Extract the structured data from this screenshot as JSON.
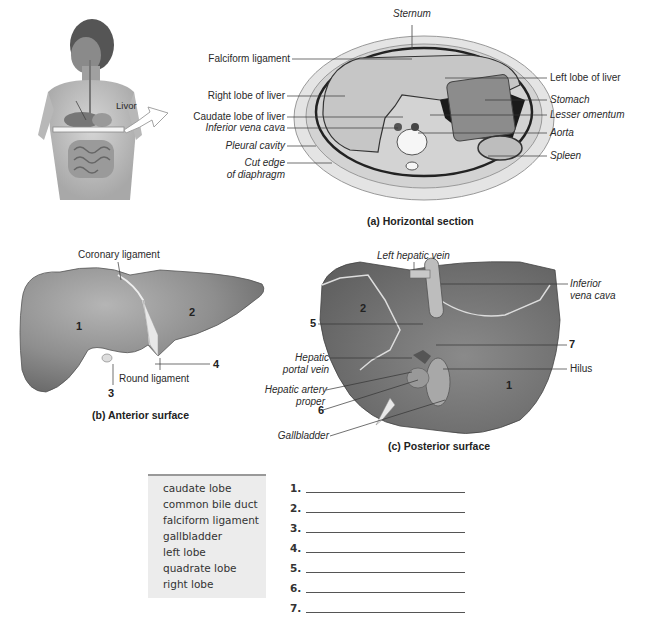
{
  "figure_a": {
    "caption": "(a) Horizontal section",
    "body_label": "Livor",
    "labels_left": [
      {
        "text": "Falciform ligament",
        "italic": false
      },
      {
        "text": "Right lobe of liver",
        "italic": false
      },
      {
        "text": "Caudate lobe of liver",
        "italic": false
      },
      {
        "text": "Inferior vena cava",
        "italic": true
      },
      {
        "text": "Pleural cavity",
        "italic": true
      },
      {
        "text": "Cut edge",
        "italic": true
      },
      {
        "text": "of diaphragm",
        "italic": true
      }
    ],
    "label_top": "Sternum",
    "labels_right": [
      {
        "text": "Left lobe of liver",
        "italic": false
      },
      {
        "text": "Stomach",
        "italic": true
      },
      {
        "text": "Lesser omentum",
        "italic": true
      },
      {
        "text": "Aorta",
        "italic": true
      },
      {
        "text": "Spleen",
        "italic": true
      }
    ]
  },
  "figure_b": {
    "caption": "(b) Anterior surface",
    "labels": {
      "coronary": "Coronary ligament",
      "round": "Round ligament"
    },
    "numbers": [
      "1",
      "2",
      "3",
      "4"
    ]
  },
  "figure_c": {
    "caption": "(c) Posterior surface",
    "labels": {
      "left_hepatic_vein": "Left hepatic vein",
      "ivc_1": "Inferior",
      "ivc_2": "vena cava",
      "portal_1": "Hepatic",
      "portal_2": "portal vein",
      "artery_1": "Hepatic artery",
      "artery_2": "proper",
      "gallbladder": "Gallbladder",
      "hilus": "Hilus"
    },
    "numbers": [
      "1",
      "2",
      "5",
      "6",
      "7"
    ]
  },
  "word_bank": [
    "caudate lobe",
    "common bile duct",
    "falciform ligament",
    "gallbladder",
    "left lobe",
    "quadrate lobe",
    "right lobe"
  ],
  "answers": [
    {
      "num": "1.",
      "value": ""
    },
    {
      "num": "2.",
      "value": ""
    },
    {
      "num": "3.",
      "value": ""
    },
    {
      "num": "4.",
      "value": ""
    },
    {
      "num": "5.",
      "value": ""
    },
    {
      "num": "6.",
      "value": ""
    },
    {
      "num": "7.",
      "value": ""
    }
  ]
}
